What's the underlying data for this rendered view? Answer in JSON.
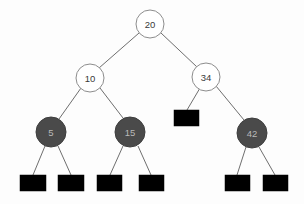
{
  "diagram": {
    "type": "binary-search-tree",
    "background_color": "#fdfdfd",
    "colors": {
      "red_node_fill": "#ffffff",
      "red_node_stroke": "#8d8d8d",
      "red_node_text": "#3a3a3a",
      "black_node_fill": "#4a4a4a",
      "black_node_stroke": "#3e3e3e",
      "black_node_text": "#b9b9b9",
      "nil_leaf_fill": "#000000",
      "edge_stroke": "#5d5d5d"
    },
    "nodes": [
      {
        "id": "n20",
        "label": "20",
        "style": "light",
        "cx": 150,
        "cy": 24,
        "r": 14
      },
      {
        "id": "n10",
        "label": "10",
        "style": "light",
        "cx": 90,
        "cy": 78,
        "r": 14
      },
      {
        "id": "n34",
        "label": "34",
        "style": "light",
        "cx": 206,
        "cy": 77,
        "r": 14
      },
      {
        "id": "n5",
        "label": "5",
        "style": "dark",
        "cx": 51,
        "cy": 132,
        "r": 15
      },
      {
        "id": "n15",
        "label": "15",
        "style": "dark",
        "cx": 130,
        "cy": 132,
        "r": 15
      },
      {
        "id": "n42",
        "label": "42",
        "style": "dark",
        "cx": 252,
        "cy": 133,
        "r": 15
      }
    ],
    "nil_leaves": [
      {
        "id": "nil34",
        "x": 174,
        "y": 110,
        "width": 25,
        "height": 16
      },
      {
        "id": "nil5L",
        "x": 20,
        "y": 175,
        "width": 26,
        "height": 16
      },
      {
        "id": "nil5R",
        "x": 58,
        "y": 175,
        "width": 26,
        "height": 16
      },
      {
        "id": "nil15L",
        "x": 97,
        "y": 175,
        "width": 25,
        "height": 16
      },
      {
        "id": "nil15R",
        "x": 139,
        "y": 175,
        "width": 25,
        "height": 16
      },
      {
        "id": "nil42L",
        "x": 225,
        "y": 175,
        "width": 25,
        "height": 16
      },
      {
        "id": "nil42R",
        "x": 263,
        "y": 175,
        "width": 25,
        "height": 16
      }
    ],
    "edges": [
      {
        "id": "e20-10",
        "from": "n20",
        "to": "n10",
        "x1": 139,
        "y1": 33,
        "x2": 99,
        "y2": 68
      },
      {
        "id": "e20-34",
        "from": "n20",
        "to": "n34",
        "x1": 161,
        "y1": 33,
        "x2": 197,
        "y2": 67
      },
      {
        "id": "e10-5",
        "from": "n10",
        "to": "n5",
        "x1": 81,
        "y1": 88,
        "x2": 59,
        "y2": 119
      },
      {
        "id": "e10-15",
        "from": "n10",
        "to": "n15",
        "x1": 100,
        "y1": 88,
        "x2": 123,
        "y2": 118
      },
      {
        "id": "e34-nil",
        "from": "n34",
        "to": "nil34",
        "x1": 200,
        "y1": 88,
        "x2": 187,
        "y2": 110
      },
      {
        "id": "e34-42",
        "from": "n34",
        "to": "n42",
        "x1": 216,
        "y1": 86,
        "x2": 244,
        "y2": 120
      },
      {
        "id": "e5-nilL",
        "from": "n5",
        "to": "nil5L",
        "x1": 45,
        "y1": 146,
        "x2": 33,
        "y2": 175
      },
      {
        "id": "e5-nilR",
        "from": "n5",
        "to": "nil5R",
        "x1": 58,
        "y1": 146,
        "x2": 71,
        "y2": 175
      },
      {
        "id": "e15-nilL",
        "from": "n15",
        "to": "nil15L",
        "x1": 123,
        "y1": 146,
        "x2": 110,
        "y2": 175
      },
      {
        "id": "e15-nilR",
        "from": "n15",
        "to": "nil15R",
        "x1": 138,
        "y1": 146,
        "x2": 151,
        "y2": 175
      },
      {
        "id": "e42-nilL",
        "from": "n42",
        "to": "nil42L",
        "x1": 246,
        "y1": 147,
        "x2": 237,
        "y2": 175
      },
      {
        "id": "e42-nilR",
        "from": "n42",
        "to": "nil42R",
        "x1": 259,
        "y1": 147,
        "x2": 275,
        "y2": 175
      }
    ]
  }
}
